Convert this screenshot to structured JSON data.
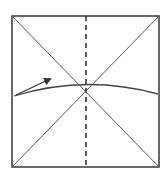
{
  "diagram": {
    "type": "origami-fold-step",
    "colors": {
      "background": "#ffffff",
      "stroke": "#555555",
      "border": "#444444"
    },
    "square": {
      "x": 12,
      "y": 16,
      "w": 147,
      "h": 151
    },
    "diagonals": [
      {
        "x1": 12,
        "y1": 16,
        "x2": 159,
        "y2": 167
      },
      {
        "x1": 159,
        "y1": 16,
        "x2": 12,
        "y2": 167
      }
    ],
    "valley_fold": {
      "x1": 86,
      "y1": 16,
      "x2": 86,
      "y2": 167,
      "dash": "5,4"
    },
    "curve": {
      "d": "M14 96 Q86 74 158 94"
    },
    "arrow": {
      "x1": 16,
      "y1": 95,
      "x2": 52,
      "y2": 78
    }
  }
}
